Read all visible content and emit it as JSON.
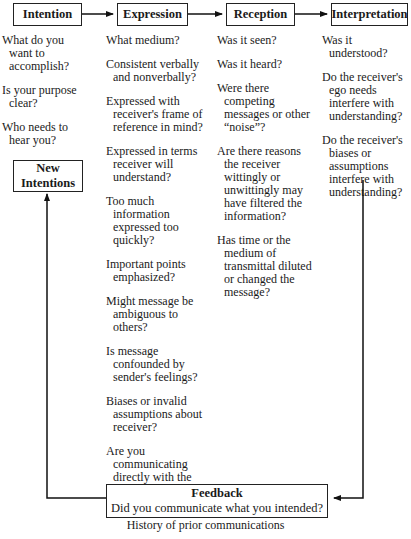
{
  "stages": [
    {
      "label": "Intention",
      "questions": [
        "What do you want to accomplish?",
        "Is your purpose clear?",
        "Who needs to hear you?"
      ]
    },
    {
      "label": "Expression",
      "questions": [
        "What medium?",
        "Consistent verbally and nonverbally?",
        "Expressed with receiver's frame of reference in mind?",
        "Expressed in terms receiver will understand?",
        "Too much information expressed too quickly?",
        "Important points emphasized?",
        "Might message be ambiguous to others?",
        "Is message confounded by sender's feelings?",
        "Biases or invalid assumptions about receiver?",
        "Are you communicating directly with the receiver or through others?"
      ]
    },
    {
      "label": "Reception",
      "questions": [
        "Was it seen?",
        "Was it heard?",
        "Were there competing messages or other “noise”?",
        "Are there reasons the receiver wittingly or unwittingly may have filtered the information?",
        "Has time or the medium of transmittal diluted or changed the message?"
      ]
    },
    {
      "label": "Interpretation",
      "questions": [
        "Was it understood?",
        "Do the receiver's ego needs interfere with understanding?",
        "Do the receiver's biases or assumptions interfere with understanding?"
      ]
    }
  ],
  "new_intentions": {
    "line1": "New",
    "line2": "Intentions"
  },
  "feedback": {
    "title": "Feedback",
    "question": "Did you communicate what you intended?"
  },
  "caption": "History of prior communications"
}
